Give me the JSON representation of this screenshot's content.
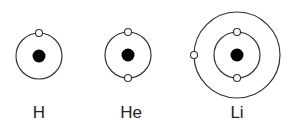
{
  "diagram": {
    "type": "bohr-atomic-models",
    "atoms": [
      {
        "symbol": "H",
        "center": [
          39,
          56
        ],
        "orbits": [
          {
            "radius": 23,
            "electrons": [
              "top"
            ]
          }
        ],
        "electron_count": 1
      },
      {
        "symbol": "He",
        "center": [
          128,
          55
        ],
        "orbits": [
          {
            "radius": 23,
            "electrons": [
              "top",
              "bottom"
            ]
          }
        ],
        "electron_count": 2
      },
      {
        "symbol": "Li",
        "center": [
          237,
          55
        ],
        "orbits": [
          {
            "radius": 23,
            "electrons": [
              "top",
              "bottom"
            ]
          },
          {
            "radius": 43,
            "electrons": [
              "left"
            ]
          }
        ],
        "electron_count": 3
      }
    ],
    "colors": {
      "nucleus": "#000000",
      "orbit": "#333333",
      "electron_fill": "#ffffff",
      "electron_stroke": "#333333",
      "label": "#222222"
    }
  },
  "labels": {
    "h": "H",
    "he": "He",
    "li": "Li"
  }
}
